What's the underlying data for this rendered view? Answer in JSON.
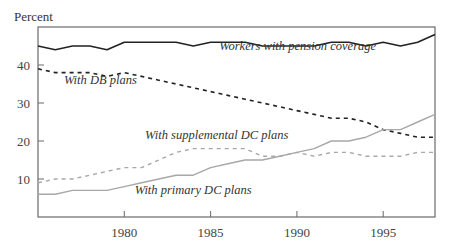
{
  "chart_data": {
    "type": "line",
    "title": "",
    "xlabel": "",
    "ylabel": "Percent",
    "xlim": [
      1975,
      1998
    ],
    "ylim": [
      0,
      50
    ],
    "grid": false,
    "legend_position": "inline labels",
    "x_ticks": [
      1980,
      1985,
      1990,
      1995
    ],
    "x_tick_labels": [
      "1980",
      "1985",
      "1990",
      "1995"
    ],
    "y_ticks": [
      10,
      20,
      30,
      40
    ],
    "y_tick_labels": [
      "10",
      "20",
      "30",
      "40"
    ],
    "x": [
      1975,
      1976,
      1977,
      1978,
      1979,
      1980,
      1981,
      1982,
      1983,
      1984,
      1985,
      1986,
      1987,
      1988,
      1989,
      1990,
      1991,
      1992,
      1993,
      1994,
      1995,
      1996,
      1997,
      1998
    ],
    "series": [
      {
        "name": "Workers with pension coverage",
        "style": "solid",
        "color": "#222222",
        "values": [
          45,
          44,
          45,
          45,
          44,
          46,
          46,
          46,
          46,
          45,
          46,
          46,
          46,
          45,
          45,
          45,
          45,
          46,
          46,
          45,
          46,
          45,
          46,
          48
        ]
      },
      {
        "name": "With DB plans",
        "style": "dashed",
        "color": "#222222",
        "values": [
          39,
          38,
          38,
          38,
          37,
          38,
          37,
          36,
          35,
          34,
          33,
          32,
          31,
          30,
          29,
          28,
          27,
          26,
          26,
          25,
          23,
          22,
          21,
          21
        ]
      },
      {
        "name": "With supplemental DC plans",
        "style": "dashed",
        "color": "#a8a8a8",
        "values": [
          9,
          10,
          10,
          11,
          12,
          13,
          13,
          15,
          17,
          18,
          18,
          18,
          18,
          16,
          16,
          17,
          16,
          17,
          17,
          16,
          16,
          16,
          17,
          17
        ]
      },
      {
        "name": "With primary DC plans",
        "style": "solid",
        "color": "#a8a8a8",
        "values": [
          6,
          6,
          7,
          7,
          7,
          8,
          9,
          10,
          11,
          11,
          13,
          14,
          15,
          15,
          16,
          17,
          18,
          20,
          20,
          21,
          23,
          23,
          25,
          27
        ]
      }
    ],
    "annotations": [
      {
        "text": "Workers with pension coverage",
        "x": 1985.5,
        "y": 44
      },
      {
        "text": "With DB plans",
        "x": 1976.5,
        "y": 35
      },
      {
        "text": "With supplemental DC plans",
        "x": 1981.2,
        "y": 20.5
      },
      {
        "text": "With primary DC plans",
        "x": 1980.6,
        "y": 6
      }
    ]
  }
}
